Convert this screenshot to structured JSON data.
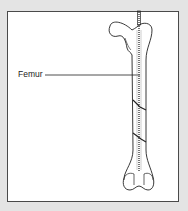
{
  "diagram": {
    "label": "Femur",
    "fracture_count": 2
  }
}
